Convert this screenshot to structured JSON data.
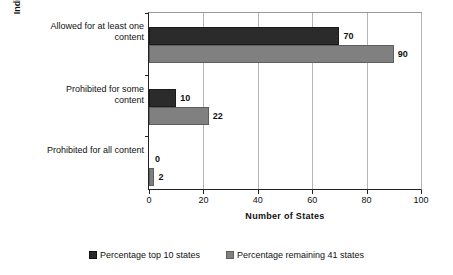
{
  "chart_data": {
    "type": "bar",
    "orientation": "horizontal",
    "title": "",
    "xlabel": "Number of States",
    "ylabel": "Indirect Linguistic Support\nAccommodations",
    "xlim": [
      0,
      100
    ],
    "xticks": [
      0,
      20,
      40,
      60,
      80,
      100
    ],
    "xtick_labels": [
      "0",
      "20",
      "40",
      "60",
      "80",
      "100"
    ],
    "grid": true,
    "grid_axis": "x",
    "legend_position": "bottom",
    "categories": [
      "Allowed for at least one content",
      "Prohibited for some content",
      "Prohibited for all content"
    ],
    "category_labels": [
      "Allowed for at least\none content",
      "Prohibited for some\ncontent",
      "Prohibited for all\ncontent"
    ],
    "series": [
      {
        "name": "Percentage top 10 states",
        "color": "#2b2b2b",
        "values": [
          70,
          10,
          0
        ],
        "value_labels": [
          "70",
          "10",
          "0"
        ]
      },
      {
        "name": "Percentage remaining 41 states",
        "color": "#808080",
        "values": [
          90,
          22,
          2
        ],
        "value_labels": [
          "90",
          "22",
          "2"
        ]
      }
    ]
  },
  "legend": {
    "items": [
      {
        "label": "Percentage top 10 states",
        "swatch": "dark"
      },
      {
        "label": "Percentage remaining 41 states",
        "swatch": "light"
      }
    ]
  },
  "colors": {
    "series_dark": "#2b2b2b",
    "series_light": "#808080",
    "axis": "#222222",
    "gridline": "#b5b5b5",
    "background": "#ffffff"
  }
}
